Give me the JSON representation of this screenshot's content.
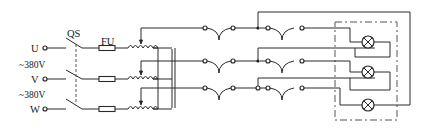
{
  "diagram": {
    "labels": {
      "switch": "QS",
      "fuse": "FU",
      "phase_u": "U",
      "phase_v": "V",
      "phase_w": "W",
      "voltage_uv": "~380V",
      "voltage_vw": "~380V"
    },
    "components": {
      "inputs": [
        "U",
        "V",
        "W"
      ],
      "switch": "QS (3-pole, ganged)",
      "fuses": 3,
      "autotransformers": 3,
      "connectors": 6,
      "lamps": 3
    },
    "colors": {
      "line": "#2a2a2a",
      "background": "#ffffff"
    }
  }
}
